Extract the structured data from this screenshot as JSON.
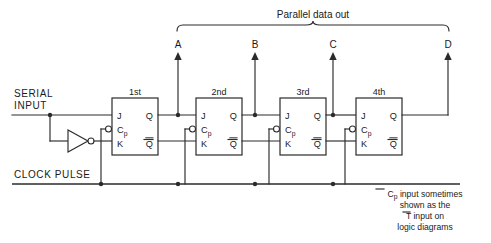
{
  "diagram": {
    "title": "Parallel data out",
    "serial_input_label_line1": "SERIAL",
    "serial_input_label_line2": "INPUT",
    "clock_label": "CLOCK PULSE",
    "output_labels": [
      "A",
      "B",
      "C",
      "D"
    ],
    "stages": [
      {
        "name": "1st",
        "j": "J",
        "cp": "C",
        "cp_sub": "p",
        "k": "K",
        "q": "Q",
        "qbar": "Q"
      },
      {
        "name": "2nd",
        "j": "J",
        "cp": "C",
        "cp_sub": "p",
        "k": "K",
        "q": "Q",
        "qbar": "Q"
      },
      {
        "name": "3rd",
        "j": "J",
        "cp": "C",
        "cp_sub": "p",
        "k": "K",
        "q": "Q",
        "qbar": "Q"
      },
      {
        "name": "4th",
        "j": "J",
        "cp": "C",
        "cp_sub": "p",
        "k": "K",
        "q": "Q",
        "qbar": "Q"
      }
    ],
    "note": {
      "line1_a": "C",
      "line1_sub": "p",
      "line1_b": " input sometimes",
      "line2": "shown as the",
      "line3_a": "T",
      "line3_b": " input on",
      "line4": "logic diagrams"
    },
    "colors": {
      "background": "#ffffff",
      "ink": "#2b2b2b",
      "text": "#1a1a1a"
    }
  }
}
